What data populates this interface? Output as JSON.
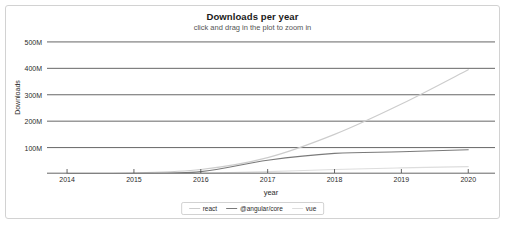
{
  "chart_data": {
    "type": "line",
    "title": "Downloads per year",
    "subtitle": "click and drag in the plot to zoom in",
    "xlabel": "year",
    "ylabel": "Downloads",
    "grid": true,
    "legend_position": "bottom",
    "xlim": [
      2013.7,
      2020.4
    ],
    "ylim": [
      0,
      530
    ],
    "x_ticks": [
      "2014",
      "2015",
      "2016",
      "2017",
      "2018",
      "2019",
      "2020"
    ],
    "y_ticks": [
      "100M",
      "200M",
      "300M",
      "400M",
      "500M"
    ],
    "y_tick_values": [
      100,
      200,
      300,
      400,
      500
    ],
    "unit": "millions of downloads",
    "x": [
      2014,
      2015,
      2016,
      2017,
      2018,
      2019,
      2020
    ],
    "series": [
      {
        "name": "react",
        "color": "#cccccc",
        "values": [
          1,
          4,
          17,
          62,
          150,
          265,
          395
        ]
      },
      {
        "name": "@angular/core",
        "color": "#7a7a7a",
        "values": [
          0,
          1,
          9,
          52,
          78,
          84,
          92
        ]
      },
      {
        "name": "vue",
        "color": "#dddddd",
        "values": [
          0,
          1,
          3,
          9,
          17,
          23,
          28
        ]
      }
    ]
  },
  "legend": {
    "items": [
      {
        "label": "react",
        "color": "#cccccc"
      },
      {
        "label": "@angular/core",
        "color": "#7a7a7a"
      },
      {
        "label": "vue",
        "color": "#dddddd"
      }
    ]
  },
  "colors": {
    "grid": "#555555",
    "border": "#d2d2d2",
    "text": "#2b2b2b",
    "background": "#ffffff"
  }
}
